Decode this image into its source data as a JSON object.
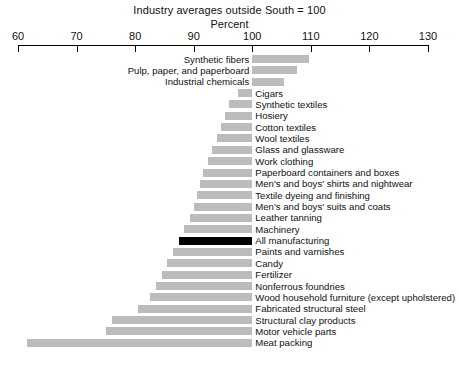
{
  "header": {
    "title": "Industry averages outside South = 100",
    "subtitle": "Percent"
  },
  "axis": {
    "ticks": [
      "60",
      "70",
      "80",
      "90",
      "100",
      "110",
      "120",
      "130"
    ]
  },
  "chart_data": {
    "type": "bar",
    "orientation": "horizontal",
    "title": "Industry averages outside South = 100",
    "subtitle": "Percent",
    "xlabel": "Percent",
    "ylabel": "",
    "xlim": [
      60,
      130
    ],
    "baseline": 100,
    "grid": false,
    "legend": null,
    "xticks": [
      60,
      70,
      80,
      90,
      100,
      110,
      120,
      130
    ],
    "colors": {
      "bar": "#bcbcbc",
      "highlight": "#000000",
      "axis": "#000000",
      "background": "#ffffff"
    },
    "highlight_category": "All manufacturing",
    "categories": [
      "Synthetic fibers",
      "Pulp, paper, and paperboard",
      "Industrial chemicals",
      "Cigars",
      "Synthetic textiles",
      "Hosiery",
      "Cotton textiles",
      "Wool textiles",
      "Glass and glassware",
      "Work clothing",
      "Paperboard containers and boxes",
      "Men's and boys' shirts and nightwear",
      "Textile dyeing and finishing",
      "Men's and boys' suits and coats",
      "Leather tanning",
      "Machinery",
      "All manufacturing",
      "Paints and varnishes",
      "Candy",
      "Fertilizer",
      "Nonferrous foundries",
      "Wood household furniture (except upholstered)",
      "Fabricated structural steel",
      "Structural clay products",
      "Motor vehicle parts",
      "Meat packing"
    ],
    "values": [
      109.6,
      107.7,
      105.5,
      97.5,
      96.0,
      95.3,
      94.7,
      94.0,
      93.2,
      92.5,
      91.5,
      91.0,
      90.5,
      90.0,
      89.3,
      88.3,
      87.5,
      86.5,
      85.5,
      84.5,
      83.5,
      82.5,
      80.5,
      76.0,
      75.0,
      61.5
    ]
  }
}
